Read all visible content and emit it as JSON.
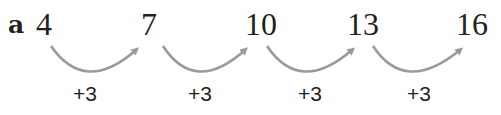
{
  "part_label": "a",
  "sequence": [
    "4",
    "7",
    "10",
    "13",
    "16"
  ],
  "steps": [
    "+3",
    "+3",
    "+3",
    "+3"
  ],
  "colors": {
    "text": "#231f20",
    "arrow": "#9a9a9a"
  }
}
